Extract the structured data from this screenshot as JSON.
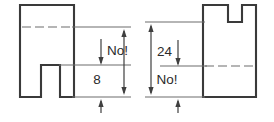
{
  "drawing": {
    "title": "Engineering dimension annotation comparison",
    "canvas": {
      "width": 274,
      "height": 122,
      "background": "#ffffff"
    },
    "colors": {
      "outline": "#3a3a3a",
      "centerline": "#6d6d6d",
      "extension_line": "#6d6d6d",
      "dimension_line": "#3f3f3f",
      "text": "#2b2b2b",
      "background": "#ffffff"
    },
    "views": [
      {
        "id": "left-view",
        "name": "left-part-view",
        "description": "Block with rectangular notch cut upward from the bottom edge",
        "notch_position": "bottom",
        "dimensions": [
          {
            "id": "left-dim-upper",
            "label": "No!",
            "value": "No!",
            "kind": "rejected-dimension"
          },
          {
            "id": "left-dim-lower",
            "label": "8",
            "value": "8",
            "kind": "dimension"
          }
        ]
      },
      {
        "id": "right-view",
        "name": "right-part-view",
        "description": "Block with rectangular notch cut downward from the top edge",
        "notch_position": "top",
        "dimensions": [
          {
            "id": "right-dim-outer",
            "label": "24",
            "value": "24",
            "kind": "dimension"
          },
          {
            "id": "right-dim-inner",
            "label": "No!",
            "value": "No!",
            "kind": "rejected-dimension"
          }
        ]
      }
    ],
    "labels": {
      "left_upper": "No!",
      "left_lower": "8",
      "right_outer": "24",
      "right_inner": "No!"
    }
  }
}
